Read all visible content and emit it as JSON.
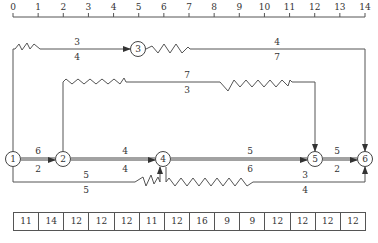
{
  "scale": {
    "ticks": [
      "0",
      "1",
      "2",
      "3",
      "4",
      "5",
      "6",
      "7",
      "8",
      "9",
      "10",
      "11",
      "12",
      "13",
      "14"
    ]
  },
  "nodes": [
    {
      "id": "1",
      "label": "1"
    },
    {
      "id": "2",
      "label": "2"
    },
    {
      "id": "3",
      "label": "3"
    },
    {
      "id": "4",
      "label": "4"
    },
    {
      "id": "5",
      "label": "5"
    },
    {
      "id": "6",
      "label": "6"
    }
  ],
  "activities": [
    {
      "from": "1",
      "to": "3",
      "top": "3",
      "bottom": "4",
      "critical": false
    },
    {
      "from": "3",
      "to": "6",
      "top": "4",
      "bottom": "7",
      "critical": false
    },
    {
      "from": "2",
      "to": "5",
      "top": "7",
      "bottom": "3",
      "critical": false
    },
    {
      "from": "1",
      "to": "2",
      "top": "6",
      "bottom": "2",
      "critical": true
    },
    {
      "from": "2",
      "to": "4",
      "top": "4",
      "bottom": "4",
      "critical": true
    },
    {
      "from": "4",
      "to": "5",
      "top": "5",
      "bottom": "6",
      "critical": true
    },
    {
      "from": "5",
      "to": "6",
      "top": "5",
      "bottom": "2",
      "critical": true
    },
    {
      "from": "1",
      "to": "4",
      "top": "5",
      "bottom": "5",
      "critical": false
    },
    {
      "from": "4",
      "to": "6",
      "top": "3",
      "bottom": "4",
      "critical": false
    }
  ],
  "resource_table": {
    "values": [
      "11",
      "14",
      "12",
      "12",
      "12",
      "11",
      "12",
      "16",
      "9",
      "9",
      "12",
      "12",
      "12",
      "12"
    ]
  },
  "colors": {
    "line": "#555555",
    "critical": "#444444",
    "text": "#333333"
  }
}
